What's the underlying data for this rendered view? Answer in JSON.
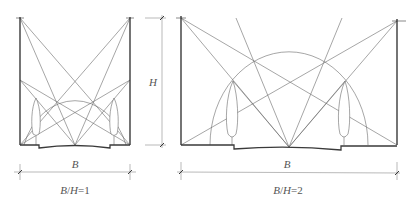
{
  "diagrams": [
    {
      "id": "street-section-1",
      "ratio_label_B": "B",
      "ratio_label_slash": "/",
      "ratio_label_H": "H",
      "ratio_label_eq": "=1",
      "width_label": "B",
      "ratio": "B/H=1"
    },
    {
      "id": "street-section-2",
      "ratio_label_B": "B",
      "ratio_label_slash": "/",
      "ratio_label_H": "H",
      "ratio_label_eq": "=2",
      "width_label": "B",
      "ratio": "B/H=2"
    }
  ],
  "height_dimension": {
    "label": "H"
  },
  "colors": {
    "wall": "#3a3a3a",
    "line": "#6a6a6a",
    "dimension": "#8a8a8a",
    "text": "#555555"
  }
}
